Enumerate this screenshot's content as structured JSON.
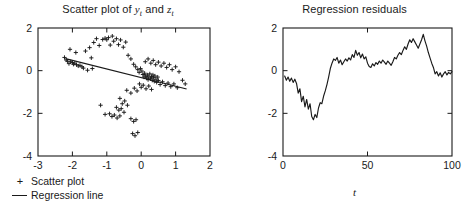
{
  "figure": {
    "background": "#ffffff",
    "ink": "#1a1a1a"
  },
  "panels": {
    "scatter": {
      "title_prefix": "Scatter plot of ",
      "title_var1": "y",
      "title_and": " and ",
      "title_var2": "z",
      "subscript": "t",
      "legend": [
        {
          "key": "plus-marker",
          "label": "Scatter plot"
        },
        {
          "key": "line-segment",
          "label": "Regression line"
        }
      ]
    },
    "residuals": {
      "title": "Regression residuals",
      "ylabel_var": "e",
      "ylabel_sub": "t",
      "xlabel_var": "t"
    }
  },
  "chart_data": [
    {
      "type": "scatter",
      "title": "Scatter plot of y_t and z_t",
      "xlabel": "",
      "ylabel": "",
      "xlim": [
        -3,
        2
      ],
      "ylim": [
        -4,
        2
      ],
      "xticks": [
        -3,
        -2,
        -1,
        0,
        1,
        2
      ],
      "yticks": [
        -4,
        -2,
        0,
        2
      ],
      "xtick_labels": [
        "-3",
        "-2",
        "-1",
        "0",
        "1",
        "2"
      ],
      "ytick_labels": [
        "-4",
        "-2",
        "0",
        "2"
      ],
      "grid": false,
      "marker": "plus",
      "legend": [
        "Scatter plot",
        "Regression line"
      ],
      "legend_position": "below-left",
      "regression_line": {
        "x": [
          -2.2,
          1.32
        ],
        "y": [
          0.56,
          -0.86
        ],
        "slope": -0.403,
        "intercept": -0.33
      },
      "points": [
        [
          -2.23,
          0.62
        ],
        [
          -2.18,
          0.5
        ],
        [
          -2.14,
          0.44
        ],
        [
          -2.1,
          0.33
        ],
        [
          -2.05,
          0.42
        ],
        [
          -2.0,
          0.38
        ],
        [
          -1.97,
          0.3
        ],
        [
          -1.93,
          0.35
        ],
        [
          -1.88,
          0.28
        ],
        [
          -1.83,
          0.22
        ],
        [
          -1.78,
          0.25
        ],
        [
          -1.72,
          0.18
        ],
        [
          -2.07,
          1.0
        ],
        [
          -1.9,
          0.85
        ],
        [
          -1.62,
          0.92
        ],
        [
          -1.5,
          1.08
        ],
        [
          -1.45,
          0.6
        ],
        [
          -1.38,
          1.32
        ],
        [
          -1.3,
          1.5
        ],
        [
          -1.22,
          1.18
        ],
        [
          -1.12,
          1.46
        ],
        [
          -1.05,
          1.52
        ],
        [
          -1.0,
          1.45
        ],
        [
          -0.95,
          1.55
        ],
        [
          -0.9,
          1.2
        ],
        [
          -0.84,
          1.62
        ],
        [
          -0.8,
          1.38
        ],
        [
          -0.72,
          1.5
        ],
        [
          -0.66,
          1.22
        ],
        [
          -0.6,
          1.44
        ],
        [
          -0.52,
          1.1
        ],
        [
          -0.45,
          1.34
        ],
        [
          -1.68,
          0.12
        ],
        [
          -1.56,
          0.02
        ],
        [
          -1.42,
          0.1
        ],
        [
          -0.38,
          0.72
        ],
        [
          -0.3,
          0.55
        ],
        [
          -0.22,
          0.3
        ],
        [
          -0.16,
          0.18
        ],
        [
          -0.1,
          0.05
        ],
        [
          -0.06,
          -0.08
        ],
        [
          -0.02,
          0.1
        ],
        [
          0.02,
          -0.02
        ],
        [
          0.05,
          -0.18
        ],
        [
          0.08,
          -0.3
        ],
        [
          0.1,
          -0.12
        ],
        [
          0.13,
          -0.25
        ],
        [
          0.16,
          -0.35
        ],
        [
          0.18,
          -0.2
        ],
        [
          0.2,
          -0.42
        ],
        [
          0.22,
          -0.3
        ],
        [
          0.25,
          -0.15
        ],
        [
          0.27,
          -0.38
        ],
        [
          0.3,
          -0.28
        ],
        [
          0.32,
          -0.45
        ],
        [
          0.34,
          -0.2
        ],
        [
          0.36,
          -0.33
        ],
        [
          0.38,
          -0.5
        ],
        [
          0.4,
          -0.25
        ],
        [
          0.43,
          -0.4
        ],
        [
          0.45,
          -0.55
        ],
        [
          0.48,
          -0.3
        ],
        [
          0.5,
          -0.46
        ],
        [
          0.12,
          0.42
        ],
        [
          0.2,
          0.55
        ],
        [
          0.28,
          0.35
        ],
        [
          0.35,
          0.48
        ],
        [
          0.42,
          0.28
        ],
        [
          0.5,
          0.4
        ],
        [
          0.58,
          0.22
        ],
        [
          0.66,
          0.35
        ],
        [
          0.74,
          0.15
        ],
        [
          0.82,
          0.28
        ],
        [
          0.9,
          0.05
        ],
        [
          1.0,
          0.18
        ],
        [
          1.1,
          -0.05
        ],
        [
          1.2,
          -0.45
        ],
        [
          1.28,
          -0.62
        ],
        [
          0.55,
          -0.65
        ],
        [
          0.62,
          -0.52
        ],
        [
          0.7,
          -0.7
        ],
        [
          0.78,
          -0.58
        ],
        [
          0.86,
          -0.75
        ],
        [
          0.95,
          -0.62
        ],
        [
          1.05,
          -0.8
        ],
        [
          -0.05,
          -0.62
        ],
        [
          0.0,
          -0.78
        ],
        [
          0.06,
          -0.68
        ],
        [
          0.14,
          -0.85
        ],
        [
          0.22,
          -0.72
        ],
        [
          0.3,
          -0.88
        ],
        [
          -0.12,
          -0.95
        ],
        [
          -0.2,
          -0.82
        ],
        [
          -0.3,
          -1.05
        ],
        [
          -0.42,
          -0.92
        ],
        [
          -0.62,
          -1.3
        ],
        [
          -0.55,
          -1.55
        ],
        [
          -0.48,
          -1.42
        ],
        [
          -0.4,
          -1.62
        ],
        [
          -0.72,
          -1.72
        ],
        [
          -0.65,
          -1.85
        ],
        [
          -0.58,
          -1.78
        ],
        [
          -0.5,
          -1.95
        ],
        [
          -0.92,
          -2.02
        ],
        [
          -0.85,
          -2.15
        ],
        [
          -0.78,
          -2.08
        ],
        [
          -0.7,
          -2.22
        ],
        [
          -0.62,
          -2.12
        ],
        [
          -1.18,
          -1.62
        ],
        [
          -1.05,
          -2.05
        ],
        [
          -0.3,
          -2.25
        ],
        [
          -0.22,
          -2.38
        ],
        [
          -0.15,
          -2.3
        ],
        [
          -0.25,
          -2.95
        ],
        [
          -0.18,
          -3.05
        ],
        [
          -0.1,
          -2.9
        ]
      ]
    },
    {
      "type": "line",
      "title": "Regression residuals",
      "xlabel": "t",
      "ylabel": "e_t",
      "xlim": [
        0,
        100
      ],
      "ylim": [
        -4,
        2
      ],
      "xticks": [
        0,
        50,
        100
      ],
      "yticks": [
        -4,
        -2,
        0,
        2
      ],
      "xtick_labels": [
        "0",
        "50",
        "100"
      ],
      "ytick_labels": [
        "-4",
        "-2",
        "0",
        "2"
      ],
      "grid": false,
      "series": [
        {
          "name": "residual",
          "x": [
            1,
            2,
            3,
            4,
            5,
            6,
            7,
            8,
            9,
            10,
            11,
            12,
            13,
            14,
            15,
            16,
            17,
            18,
            19,
            20,
            21,
            22,
            23,
            24,
            25,
            26,
            27,
            28,
            29,
            30,
            31,
            32,
            33,
            34,
            35,
            36,
            37,
            38,
            39,
            40,
            41,
            42,
            43,
            44,
            45,
            46,
            47,
            48,
            49,
            50,
            51,
            52,
            53,
            54,
            55,
            56,
            57,
            58,
            59,
            60,
            61,
            62,
            63,
            64,
            65,
            66,
            67,
            68,
            69,
            70,
            71,
            72,
            73,
            74,
            75,
            76,
            77,
            78,
            79,
            80,
            81,
            82,
            83,
            84,
            85,
            86,
            87,
            88,
            89,
            90,
            91,
            92,
            93,
            94,
            95,
            96,
            97,
            98,
            99,
            100
          ],
          "values": [
            -0.25,
            -0.45,
            -0.3,
            -0.5,
            -0.35,
            -0.55,
            -0.4,
            -0.6,
            -1.05,
            -0.85,
            -1.45,
            -1.2,
            -1.7,
            -1.35,
            -1.8,
            -1.55,
            -2.15,
            -2.3,
            -2.05,
            -2.2,
            -1.75,
            -1.5,
            -1.55,
            -1.2,
            -0.95,
            -0.65,
            -0.3,
            0.1,
            0.35,
            0.55,
            0.48,
            0.62,
            0.35,
            0.5,
            0.28,
            0.42,
            0.55,
            0.45,
            0.6,
            0.5,
            0.75,
            0.62,
            0.95,
            0.72,
            0.85,
            0.6,
            0.78,
            0.55,
            0.65,
            0.35,
            0.2,
            0.15,
            0.32,
            0.22,
            0.38,
            0.3,
            0.45,
            0.35,
            0.5,
            0.4,
            0.3,
            0.45,
            0.35,
            0.25,
            0.42,
            0.62,
            0.55,
            0.72,
            0.85,
            0.75,
            0.95,
            1.12,
            1.0,
            1.25,
            1.45,
            1.32,
            1.5,
            1.35,
            1.2,
            1.05,
            1.25,
            1.45,
            1.7,
            1.4,
            1.15,
            0.85,
            0.6,
            0.35,
            0.15,
            -0.15,
            -0.05,
            -0.25,
            -0.1,
            -0.3,
            -0.15,
            -0.05,
            -0.2,
            -0.08,
            -0.15,
            -0.05
          ]
        }
      ]
    }
  ]
}
